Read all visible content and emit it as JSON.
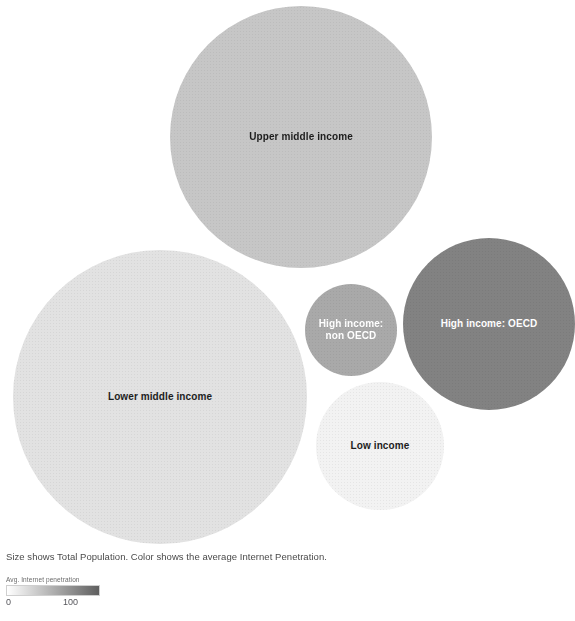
{
  "caption": "Size shows Total Population. Color shows the average Internet Penetration.",
  "legend": {
    "title": "Avg. Internet penetration",
    "min_label": "0",
    "max_label": "100",
    "ramp_start_color": "#ffffff",
    "ramp_end_color": "#5f5f5f"
  },
  "chart_data": {
    "type": "bubble",
    "title": "",
    "subtitle": "",
    "xlabel": "",
    "ylabel": "",
    "grid": false,
    "legend_position": "bottom-left",
    "size_encoding": "Total Population",
    "color_encoding": "Avg. Internet penetration",
    "color_scale": {
      "type": "sequential-gray",
      "domain": [
        0,
        100
      ],
      "range": [
        "#ffffff",
        "#5f5f5f"
      ]
    },
    "categories": [
      "Upper middle income",
      "Lower middle income",
      "High income: OECD",
      "High income: non OECD",
      "Low income"
    ],
    "points": [
      {
        "label": "Upper middle income",
        "label_display": "Upper middle income",
        "size_value": 2500,
        "color_value": 42,
        "fill": "#c6c6c6",
        "text_color": "#1d1d1d",
        "cx": 301,
        "cy": 137,
        "r": 131
      },
      {
        "label": "Lower middle income",
        "label_display": "Lower middle income",
        "size_value": 3000,
        "color_value": 16,
        "fill": "#e2e2e2",
        "text_color": "#1d1d1d",
        "cx": 160,
        "cy": 397,
        "r": 147
      },
      {
        "label": "High income: OECD",
        "label_display": "High income: OECD",
        "size_value": 1050,
        "color_value": 78,
        "fill": "#828282",
        "text_color": "#ffffff",
        "cx": 489,
        "cy": 324,
        "r": 86
      },
      {
        "label": "High income: non OECD",
        "label_display": "High income:\nnon OECD",
        "size_value": 300,
        "color_value": 60,
        "fill": "#a9a9a9",
        "text_color": "#ffffff",
        "cx": 351,
        "cy": 330,
        "r": 46
      },
      {
        "label": "Low income",
        "label_display": "Low income",
        "size_value": 580,
        "color_value": 6,
        "fill": "#f2f2f2",
        "text_color": "#1d1d1d",
        "cx": 380,
        "cy": 446,
        "r": 64
      }
    ]
  }
}
